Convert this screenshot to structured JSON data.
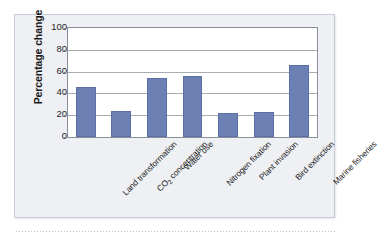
{
  "chart_data": {
    "type": "bar",
    "title": "",
    "subtitle": "",
    "xlabel": "",
    "ylabel": "Percentage change",
    "ylim": [
      0,
      100
    ],
    "yticks": [
      0,
      20,
      40,
      60,
      80,
      100
    ],
    "ytick_labels": [
      "0",
      "20",
      "40",
      "60",
      "80",
      "100"
    ],
    "grid": true,
    "legend": false,
    "legend_position": "none",
    "categories": [
      "Land transformation",
      "CO2 concentration",
      "Water use",
      "Nitrogen fixation",
      "Plant invasion",
      "Bird extinction",
      "Marine fisheries"
    ],
    "category_labels": [
      {
        "text": "Land transformation",
        "has_subscript": false,
        "pre": "Land transformation",
        "sub": "",
        "post": ""
      },
      {
        "text": "CO2 concentration",
        "has_subscript": true,
        "pre": "CO",
        "sub": "2",
        "post": " concentration"
      },
      {
        "text": "Water use",
        "has_subscript": false,
        "pre": "Water use",
        "sub": "",
        "post": ""
      },
      {
        "text": "Nitrogen fixation",
        "has_subscript": false,
        "pre": "Nitrogen fixation",
        "sub": "",
        "post": ""
      },
      {
        "text": "Plant invasion",
        "has_subscript": false,
        "pre": "Plant invasion",
        "sub": "",
        "post": ""
      },
      {
        "text": "Bird extinction",
        "has_subscript": false,
        "pre": "Bird extinction",
        "sub": "",
        "post": ""
      },
      {
        "text": "Marine fisheries",
        "has_subscript": false,
        "pre": "Marine fisheries",
        "sub": "",
        "post": ""
      }
    ],
    "values": [
      46,
      24,
      54,
      56,
      22,
      23,
      66
    ],
    "series": [
      {
        "name": "Percentage change",
        "values": [
          46,
          24,
          54,
          56,
          22,
          23,
          66
        ]
      }
    ]
  },
  "colors": {
    "bar_fill": "#6d80b4",
    "bar_stroke": "#5b6ea6",
    "card_background": "#eef0f4",
    "card_border": "#c6ccd6",
    "plot_background": "#ffffff",
    "plot_border": "#8a8f99",
    "gridline": "#a8acb3",
    "text": "#1f1f1f"
  }
}
